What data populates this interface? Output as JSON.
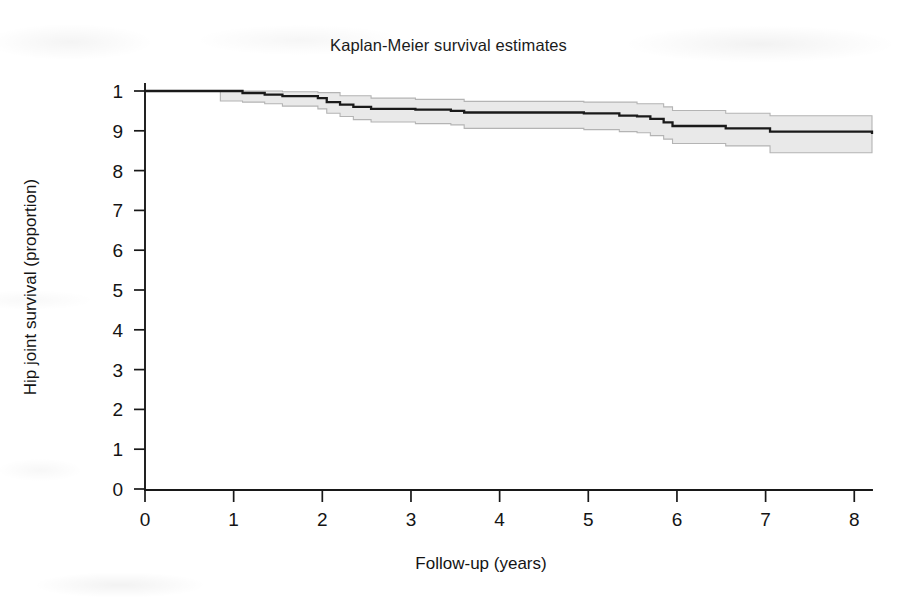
{
  "figure": {
    "width": 897,
    "height": 600,
    "background": "#ffffff"
  },
  "title": "Kaplan-Meier survival estimates",
  "axes": {
    "x_label": "Follow-up (years)",
    "y_label": "Hip joint survival (proportion)",
    "x_tick_labels": [
      "0",
      "1",
      "2",
      "3",
      "4",
      "5",
      "6",
      "7",
      "8"
    ],
    "y_tick_labels": [
      "1",
      "9",
      "8",
      "7",
      "6",
      "5",
      "4",
      "3",
      "2",
      "1",
      "0"
    ]
  },
  "colors": {
    "curve": "#1a1a1a",
    "ci_fill": "#e9e9e9",
    "ci_edge": "#b4b4b4",
    "axis": "#181818",
    "text": "#141414"
  },
  "chart_data": {
    "type": "line",
    "title": "Kaplan-Meier survival estimates",
    "xlabel": "Follow-up (years)",
    "ylabel": "Hip joint survival (proportion)",
    "xlim": [
      0,
      8.2
    ],
    "ylim": [
      0,
      1
    ],
    "xticks": [
      0,
      1,
      2,
      3,
      4,
      5,
      6,
      7,
      8
    ],
    "yticks": [
      0,
      0.1,
      0.2,
      0.3,
      0.4,
      0.5,
      0.6,
      0.7,
      0.8,
      0.9,
      1.0
    ],
    "ytick_labels_as_printed": [
      "1",
      "9",
      "8",
      "7",
      "6",
      "5",
      "4",
      "3",
      "2",
      "1",
      "0"
    ],
    "grid": false,
    "legend": null,
    "series": [
      {
        "name": "Survivor function",
        "style": "step-post",
        "x": [
          0.0,
          0.85,
          1.1,
          1.35,
          1.55,
          1.95,
          2.05,
          2.2,
          2.35,
          2.55,
          3.05,
          3.45,
          3.6,
          4.95,
          5.35,
          5.55,
          5.7,
          5.85,
          5.95,
          6.55,
          7.05,
          8.2
        ],
        "y": [
          1.0,
          1.0,
          0.995,
          0.991,
          0.987,
          0.982,
          0.972,
          0.966,
          0.96,
          0.955,
          0.953,
          0.95,
          0.946,
          0.944,
          0.938,
          0.936,
          0.93,
          0.921,
          0.912,
          0.906,
          0.898,
          0.892
        ]
      },
      {
        "name": "Upper 95% confidence limit",
        "style": "step-post",
        "x": [
          0.0,
          0.85,
          1.1,
          1.55,
          1.95,
          2.2,
          2.55,
          3.05,
          3.6,
          4.95,
          5.55,
          5.85,
          5.95,
          6.55,
          7.05,
          8.2
        ],
        "y": [
          1.0,
          1.0,
          1.0,
          0.998,
          0.996,
          0.988,
          0.982,
          0.979,
          0.974,
          0.972,
          0.968,
          0.96,
          0.951,
          0.944,
          0.938,
          0.932
        ]
      },
      {
        "name": "Lower 95% confidence limit",
        "style": "step-post",
        "x": [
          0.0,
          0.85,
          1.1,
          1.35,
          1.55,
          1.95,
          2.05,
          2.2,
          2.35,
          2.55,
          3.05,
          3.45,
          3.6,
          4.95,
          5.35,
          5.55,
          5.7,
          5.85,
          5.95,
          6.55,
          7.05,
          8.2
        ],
        "y": [
          1.0,
          0.975,
          0.972,
          0.968,
          0.962,
          0.955,
          0.944,
          0.936,
          0.928,
          0.922,
          0.918,
          0.915,
          0.906,
          0.903,
          0.898,
          0.895,
          0.888,
          0.879,
          0.868,
          0.862,
          0.845,
          0.845
        ]
      }
    ]
  }
}
